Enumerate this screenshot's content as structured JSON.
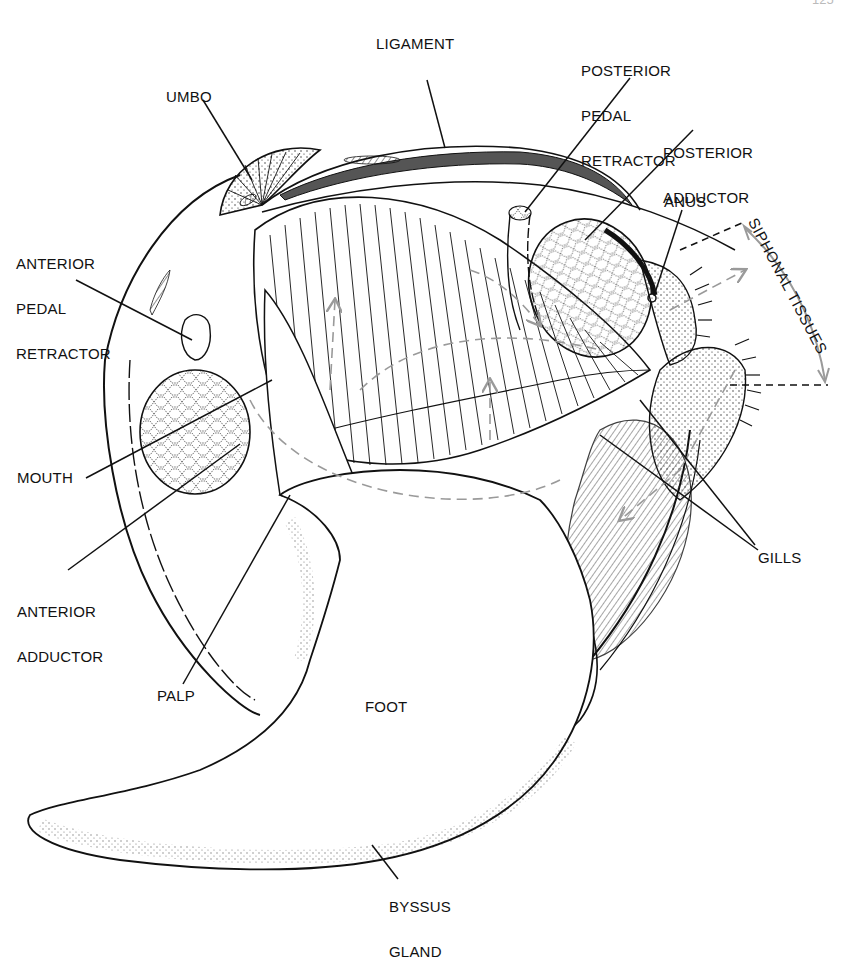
{
  "figure": {
    "page_number": "125",
    "colors": {
      "ink": "#111111",
      "ligament": "#555555",
      "arrow": "#9a9a9a",
      "background": "#ffffff"
    }
  },
  "labels": {
    "ligament": "LIGAMENT",
    "umbo": "UMBO",
    "posterior_pedal_retractor": [
      "POSTERIOR",
      "PEDAL",
      "RETRACTOR"
    ],
    "posterior_adductor": [
      "POSTERIOR",
      "ADDUCTOR"
    ],
    "anus": "ANUS",
    "siphonal_tissues": "SIPHONAL TISSUES",
    "anterior_pedal_retractor": [
      "ANTERIOR",
      "PEDAL",
      "RETRACTOR"
    ],
    "mouth": "MOUTH",
    "anterior_adductor": [
      "ANTERIOR",
      "ADDUCTOR"
    ],
    "gills": "GILLS",
    "palp": "PALP",
    "foot": "FOOT",
    "byssus_gland": [
      "BYSSUS",
      "GLAND"
    ]
  }
}
